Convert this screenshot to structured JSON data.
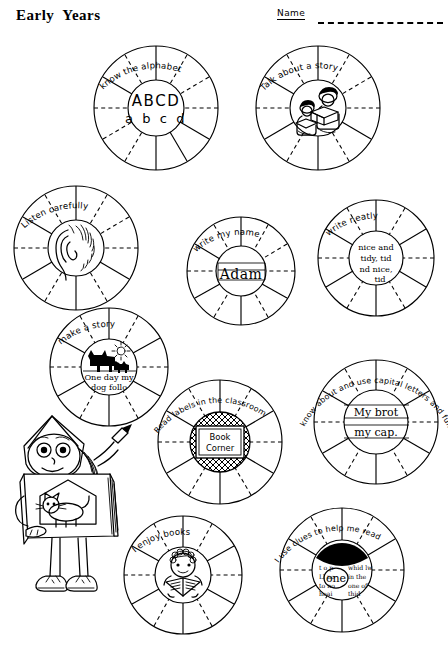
{
  "header": {
    "title": "Early  Years",
    "name_label": "Name",
    "name_rule": "dashed-write-on-line"
  },
  "wheels": [
    {
      "id": "know-the-alphabet",
      "caption": "know the alphabet",
      "hub_kind": "text",
      "hub_lines": [
        "ABCD",
        "a b c d"
      ],
      "segments": 12
    },
    {
      "id": "talk-about-a-story",
      "caption": "Talk about a story",
      "hub_kind": "picture",
      "hub_picture": "two-children-reading-icon",
      "segments": 12
    },
    {
      "id": "listen-carefully",
      "caption": "Listen carefully",
      "hub_kind": "picture",
      "hub_picture": "ear-icon",
      "segments": 12
    },
    {
      "id": "write-my-name",
      "caption": "write my name",
      "hub_kind": "handwriting",
      "hub_lines": [
        "Adam"
      ],
      "segments": 12
    },
    {
      "id": "write-neatly",
      "caption": "write neatly",
      "hub_kind": "handwriting",
      "hub_lines": [
        "nice and",
        "tidy, tid",
        "nd nice,",
        "tid"
      ],
      "segments": 12
    },
    {
      "id": "make-a-story",
      "caption": "make a story",
      "hub_kind": "picture-and-handwriting",
      "hub_picture": "dog-and-cat-icon",
      "hub_lines": [
        "One day my",
        "dog follo"
      ],
      "segments": 12
    },
    {
      "id": "read-labels-in-the-classroom",
      "caption": "Read labels in the classroom",
      "hub_kind": "sign",
      "hub_lines": [
        "Book",
        "Corner"
      ],
      "segments": 12
    },
    {
      "id": "capital-letters-and-full-stops",
      "caption": "know about and use capital letters and full stops.",
      "hub_kind": "handwriting",
      "hub_lines": [
        "My brot",
        "my cap."
      ],
      "segments": 12
    },
    {
      "id": "i-enjoy-books",
      "caption": "I enjoy books",
      "hub_kind": "picture",
      "hub_picture": "child-reading-book-icon",
      "segments": 12
    },
    {
      "id": "i-use-clues-to-help-me-read",
      "caption": "I use clues to help me read",
      "hub_kind": "picture-and-handwriting",
      "hub_picture": "circled-word-passage-icon",
      "hub_lines": [
        "one"
      ],
      "segments": 12
    }
  ],
  "mascot": {
    "name": "girl-holding-big-book",
    "book_picture": "cat-drawing"
  },
  "colors": {
    "ink": "#000000",
    "paper": "#ffffff"
  }
}
